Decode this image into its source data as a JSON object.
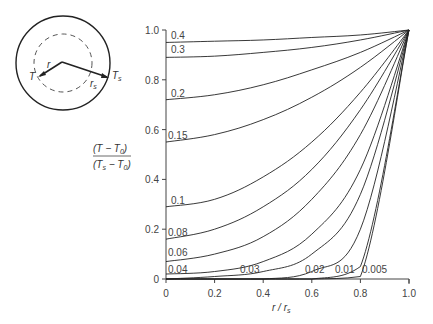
{
  "chart_data": {
    "type": "line",
    "title": "",
    "xlabel": "r / r_s",
    "ylabel": "(T − T_0) / (T_s − T_0)",
    "xlim": [
      0,
      1.0
    ],
    "ylim": [
      0,
      1.0
    ],
    "xticks": [
      "0",
      "0.2",
      "0.4",
      "0.6",
      "0.8",
      "1.0"
    ],
    "yticks": [
      "0",
      "0.2",
      "0.4",
      "0.6",
      "0.8",
      "1.0"
    ],
    "grid": false,
    "legend": "curve labels inline (Fourier number)",
    "x": [
      0,
      0.2,
      0.4,
      0.6,
      0.8,
      1.0
    ],
    "series": [
      {
        "name": "0.4",
        "values": [
          0.95,
          0.955,
          0.96,
          0.97,
          0.98,
          1.0
        ]
      },
      {
        "name": "0.3",
        "values": [
          0.89,
          0.895,
          0.91,
          0.93,
          0.96,
          1.0
        ]
      },
      {
        "name": "0.2",
        "values": [
          0.72,
          0.74,
          0.78,
          0.84,
          0.91,
          1.0
        ]
      },
      {
        "name": "0.15",
        "values": [
          0.55,
          0.58,
          0.64,
          0.73,
          0.85,
          1.0
        ]
      },
      {
        "name": "0.1",
        "values": [
          0.29,
          0.32,
          0.41,
          0.55,
          0.75,
          1.0
        ]
      },
      {
        "name": "0.08",
        "values": [
          0.16,
          0.2,
          0.29,
          0.44,
          0.68,
          1.0
        ]
      },
      {
        "name": "0.06",
        "values": [
          0.07,
          0.1,
          0.17,
          0.32,
          0.58,
          1.0
        ]
      },
      {
        "name": "0.04",
        "values": [
          0.02,
          0.03,
          0.07,
          0.18,
          0.44,
          1.0
        ]
      },
      {
        "name": "0.03",
        "values": [
          0.0,
          0.01,
          0.03,
          0.1,
          0.34,
          1.0
        ]
      },
      {
        "name": "0.02",
        "values": [
          0.0,
          0.0,
          0.0,
          0.03,
          0.2,
          1.0
        ]
      },
      {
        "name": "0.01",
        "values": [
          0.0,
          0.0,
          0.0,
          0.0,
          0.05,
          1.0
        ]
      },
      {
        "name": "0.005",
        "values": [
          0.0,
          0.0,
          0.0,
          0.0,
          0.01,
          1.0
        ]
      }
    ],
    "annotations": [
      "0.4",
      "0.3",
      "0.2",
      "0.15",
      "0.1",
      "0.08",
      "0.06",
      "0.04",
      "0.03",
      "0.02",
      "0.01",
      "0.005"
    ]
  },
  "inset": {
    "labels": {
      "T": "T",
      "Ts": "T",
      "Ts_sub": "s",
      "r": "r",
      "rs": "r",
      "rs_sub": "s"
    }
  },
  "axes": {
    "ylabel_num": "(T − T",
    "ylabel_num_sub": "0",
    "ylabel_den": "(T",
    "ylabel_den_sub1": "s",
    "ylabel_den_mid": " − T",
    "ylabel_den_sub2": "0",
    "xlabel_main": "r / r",
    "xlabel_sub": "s"
  }
}
